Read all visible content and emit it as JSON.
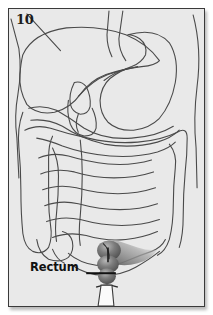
{
  "figure": {
    "number": "10",
    "type": "anatomical-illustration",
    "background_color": "#e9e9e9",
    "border_color": "#3a3a3a",
    "outline_color": "#4a4a4a",
    "page_background": "#ffffff"
  },
  "labels": [
    {
      "id": "rectum",
      "text": "Rectum",
      "color": "#111111",
      "leader_line": true,
      "leader_from_x": 78,
      "leader_to_x": 108,
      "leader_y": 266
    }
  ],
  "structures": [
    {
      "id": "esophagus",
      "name": "Esophagus",
      "shaded": false
    },
    {
      "id": "liver",
      "name": "Liver",
      "shaded": false
    },
    {
      "id": "stomach",
      "name": "Stomach",
      "shaded": false
    },
    {
      "id": "gallbladder",
      "name": "Gallbladder",
      "shaded": false
    },
    {
      "id": "duodenum",
      "name": "Duodenum",
      "shaded": false
    },
    {
      "id": "pancreas",
      "name": "Pancreas",
      "shaded": false
    },
    {
      "id": "transverse-colon",
      "name": "Transverse colon",
      "shaded": false
    },
    {
      "id": "ascending-colon",
      "name": "Ascending colon",
      "shaded": false
    },
    {
      "id": "descending-colon",
      "name": "Descending colon",
      "shaded": false
    },
    {
      "id": "small-intestine",
      "name": "Small intestine",
      "shaded": false
    },
    {
      "id": "cecum",
      "name": "Cecum",
      "shaded": false
    },
    {
      "id": "sigmoid-colon",
      "name": "Sigmoid colon",
      "shaded": true
    },
    {
      "id": "rectum",
      "name": "Rectum",
      "shaded": true
    },
    {
      "id": "anal-canal",
      "name": "Anal canal",
      "shaded": false
    }
  ],
  "highlight": {
    "target": "rectum",
    "shading_dark": "#4d4d4d",
    "shading_mid": "#7d7d7d",
    "shading_light": "#b8b8b8"
  }
}
